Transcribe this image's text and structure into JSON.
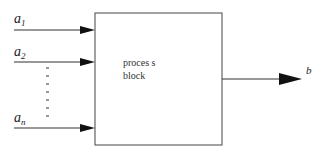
{
  "diagram": {
    "block": {
      "line1": "proces s",
      "line2": "block"
    },
    "inputs": [
      {
        "base": "a",
        "sub": "1"
      },
      {
        "base": "a",
        "sub": "2"
      },
      {
        "base": "a",
        "sub": "n"
      }
    ],
    "output": {
      "label": "b"
    },
    "colors": {
      "line": "#333333",
      "arrow": "#111111",
      "background": "#ffffff"
    }
  }
}
